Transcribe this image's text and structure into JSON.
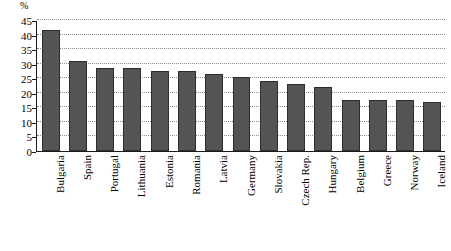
{
  "chart_data": {
    "type": "bar",
    "title": "",
    "subtitle": "",
    "xlabel": "",
    "ylabel": "%",
    "ylim": [
      0,
      45
    ],
    "ytick_step": 5,
    "yticks": [
      0,
      5,
      10,
      15,
      20,
      25,
      30,
      35,
      40,
      45
    ],
    "grid": true,
    "grid_axis": "y",
    "grid_style": "dotted",
    "legend": "none",
    "bar_color": "#545454",
    "bar_edge_color": "#2e2e2e",
    "axis_color": "#1a1a1a",
    "gridline_color": "#8c8c8c",
    "background_color": "#ffffff",
    "xtick_rotation": 90,
    "categories": [
      "Bulgaria",
      "Spain",
      "Portugal",
      "Lithuania",
      "Estonia",
      "Romania",
      "Latvia",
      "Germany",
      "Slovakia",
      "Czech Rep.",
      "Hungary",
      "Belgium",
      "Greece",
      "Norway",
      "Iceland"
    ],
    "values": [
      41.5,
      31,
      28.5,
      28.5,
      27.5,
      27.5,
      26.5,
      25.5,
      24,
      23,
      22,
      17.5,
      17.5,
      17.5,
      17
    ]
  }
}
